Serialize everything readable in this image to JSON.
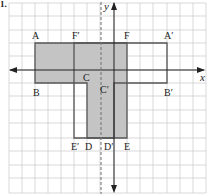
{
  "problem_number": "1.",
  "axes": {
    "x_label": "x",
    "y_label": "y"
  },
  "grid": {
    "spacing_px": 13,
    "color": "#c8c8c8"
  },
  "colors": {
    "shaded_fill": "#c4c4c4",
    "outline": "#555555",
    "axis": "#222222",
    "mirror_line": "#777777"
  },
  "mirror_line": {
    "style": "dashed",
    "orientation": "vertical",
    "position": "x = -1 (one unit left of y-axis)"
  },
  "original_shape": {
    "fill": "shaded",
    "vertices": [
      "A",
      "B",
      "C",
      "D",
      "E",
      "F"
    ]
  },
  "image_shape": {
    "fill": "none",
    "vertices": [
      "A'",
      "B'",
      "C'",
      "D'",
      "E'",
      "F'"
    ]
  },
  "labels": {
    "A": "A",
    "B": "B",
    "C": "C",
    "D": "D",
    "E": "E",
    "F": "F",
    "A_prime": "A′",
    "B_prime": "B′",
    "C_prime": "C′",
    "D_prime": "D′",
    "E_prime": "E′",
    "F_prime": "F′"
  }
}
